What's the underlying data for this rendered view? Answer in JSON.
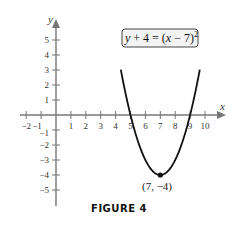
{
  "chart_data": {
    "type": "line",
    "title": "",
    "caption": "FIGURE 4",
    "xlabel": "x",
    "ylabel": "y",
    "xlim": [
      -2,
      10.5
    ],
    "ylim": [
      -5.5,
      5.5
    ],
    "x_ticks": [
      -2,
      -1,
      1,
      2,
      3,
      4,
      5,
      6,
      7,
      8,
      9,
      10
    ],
    "y_ticks": [
      -5,
      -4,
      -3,
      -2,
      -1,
      1,
      2,
      3,
      4,
      5
    ],
    "grid": false,
    "series": [
      {
        "name": "y + 4 = (x − 7)^2",
        "equation": "y = (x - 7)^2 - 4",
        "x": [
          4.6,
          5,
          5.5,
          6,
          6.5,
          7,
          7.5,
          8,
          8.5,
          9,
          9.4
        ],
        "y": [
          1.76,
          0,
          -1.75,
          -3,
          -3.75,
          -4,
          -3.75,
          -3,
          -1.75,
          0,
          1.76
        ]
      }
    ],
    "annotations": [
      {
        "text": "y + 4 = (x − 7)²",
        "type": "boxed-label",
        "position": "upper-right"
      },
      {
        "text": "(7, −4)",
        "type": "point-label",
        "x": 7,
        "y": -4
      }
    ]
  },
  "figure": {
    "caption": "FIGURE 4",
    "equation": {
      "lhs": "y + 4 = (",
      "var": "x",
      "rhs": " − 7)",
      "exponent": "2"
    },
    "vertex_label": "(7, −4)",
    "axis_x_name": "x",
    "axis_y_name": "y",
    "x_tick_labels": [
      "−2",
      "−1",
      "1",
      "2",
      "3",
      "4",
      "5",
      "6",
      "7",
      "8",
      "9",
      "10"
    ],
    "y_tick_labels": [
      "5",
      "4",
      "3",
      "2",
      "1",
      "−1",
      "−2",
      "−3",
      "−4",
      "−5"
    ],
    "colors": {
      "axis": "#777777",
      "curve": "#111111",
      "text": "#333333"
    }
  }
}
